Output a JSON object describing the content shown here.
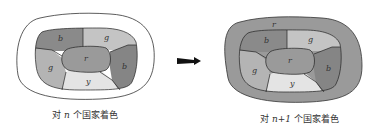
{
  "diagram": {
    "left_map": {
      "caption_prefix": "对 ",
      "caption_var": "n",
      "caption_suffix": " 个国家着色",
      "regions": [
        {
          "label": "b",
          "color": "#8a8a8a"
        },
        {
          "label": "g",
          "color": "#c4c4c4"
        },
        {
          "label": "r",
          "color": "#9a9a9a"
        },
        {
          "label": "g",
          "color": "#b4b4b4"
        },
        {
          "label": "y",
          "color": "#e4e4e4"
        },
        {
          "label": "b",
          "color": "#858585"
        }
      ],
      "outer_color": "#ffffff"
    },
    "arrow": {
      "direction": "right",
      "color": "#111111"
    },
    "right_map": {
      "caption_prefix": "对 ",
      "caption_var": "n+1",
      "caption_suffix": " 个国家着色",
      "outer_label": "r",
      "outer_color": "#9a9a9a",
      "regions": [
        {
          "label": "b",
          "color": "#8a8a8a"
        },
        {
          "label": "g",
          "color": "#c4c4c4"
        },
        {
          "label": "r",
          "color": "#9a9a9a"
        },
        {
          "label": "g",
          "color": "#b4b4b4"
        },
        {
          "label": "y",
          "color": "#e4e4e4"
        },
        {
          "label": "b",
          "color": "#858585"
        }
      ]
    }
  }
}
